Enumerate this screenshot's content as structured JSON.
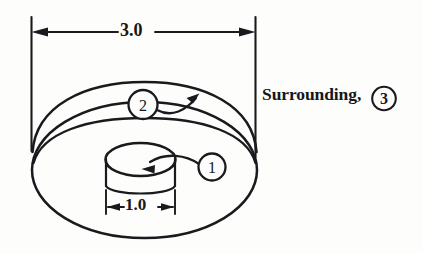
{
  "figure": {
    "title_visible": false,
    "background_color": "#fdfdfc",
    "ink_color": "#1a191d",
    "dimensions": {
      "overall_diameter": {
        "value": "3.0",
        "orientation": "horizontal",
        "position": "top",
        "arrow_style": "double-headed"
      },
      "inner_diameter": {
        "value": "1.0",
        "orientation": "horizontal",
        "position": "bottom-center",
        "arrow_style": "double-headed"
      }
    },
    "annotations": {
      "surrounding": {
        "text": "Surrounding,",
        "circled_number": "3"
      },
      "callouts": [
        {
          "number": "1",
          "points_to": "inner-cylinder",
          "arrow_direction": "down-left"
        },
        {
          "number": "2",
          "points_to": "outer-body-top-surface",
          "arrow_direction": "up-right"
        }
      ]
    }
  }
}
